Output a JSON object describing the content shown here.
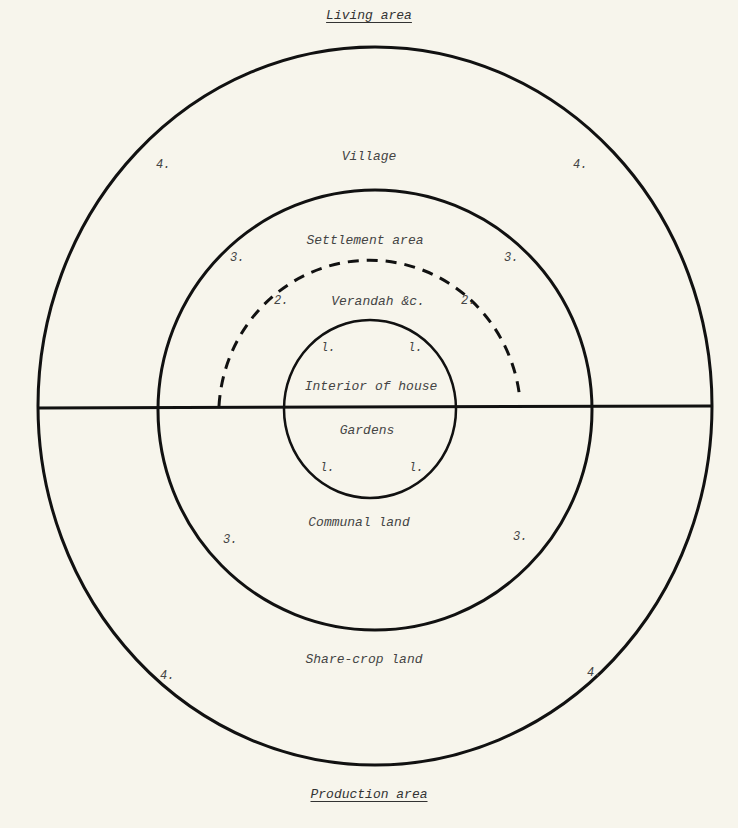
{
  "headings": {
    "top": "Living area",
    "bottom": "Production area"
  },
  "zones": {
    "village": "Village",
    "settlement_area": "Settlement area",
    "verandah": "Verandah &c.",
    "interior_of_house": "Interior of house",
    "gardens": "Gardens",
    "communal_land": "Communal land",
    "share_crop_land": "Share-crop land"
  },
  "markers": {
    "ring1": "l.",
    "ring2": "2.",
    "ring3": "3.",
    "ring4": "4."
  },
  "colors": {
    "paper": "#f7f5ec",
    "ink": "#111111",
    "text": "#444444"
  }
}
